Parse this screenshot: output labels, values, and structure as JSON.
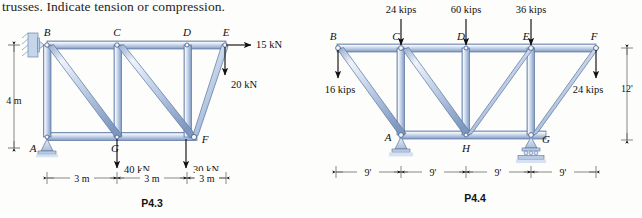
{
  "page": {
    "prompt_text": "trusses. Indicate tension or compression."
  },
  "figures": [
    {
      "caption": "P4.3",
      "units": "kN",
      "joint_labels": [
        "B",
        "C",
        "D",
        "E",
        "A",
        "G",
        "F"
      ],
      "loads": [
        {
          "label": "15 kN",
          "at": "E",
          "direction": "right"
        },
        {
          "label": "20 kN",
          "at": "E",
          "direction": "down"
        },
        {
          "label": "40 kN",
          "at": "G",
          "direction": "down"
        },
        {
          "label": "30 kN",
          "at": "F",
          "direction": "down"
        }
      ],
      "dimensions": {
        "vertical": "4 m",
        "horizontal": [
          "3 m",
          "3 m",
          "3 m"
        ]
      },
      "supports": [
        {
          "at": "B",
          "type": "wall-pin"
        },
        {
          "at": "A",
          "type": "pin"
        }
      ]
    },
    {
      "caption": "P4.4",
      "units": "kips",
      "joint_labels": [
        "B",
        "C",
        "D",
        "E",
        "F",
        "A",
        "H",
        "G"
      ],
      "loads": [
        {
          "label": "24 kips",
          "at": "C",
          "direction": "down"
        },
        {
          "label": "60 kips",
          "at": "D",
          "direction": "down"
        },
        {
          "label": "36 kips",
          "at": "E",
          "direction": "down"
        },
        {
          "label": "16 kips",
          "at": "B",
          "direction": "down"
        },
        {
          "label": "24 kips",
          "at": "F",
          "direction": "down"
        }
      ],
      "dimensions": {
        "vertical": "12'",
        "horizontal": [
          "9'",
          "9'",
          "9'",
          "9'"
        ]
      },
      "supports": [
        {
          "at": "A",
          "type": "pin"
        },
        {
          "at": "G",
          "type": "rocker"
        }
      ]
    }
  ],
  "colors": {
    "member_light": "#e8eef8",
    "member_mid": "#aabedd",
    "member_dark": "#7f99c2",
    "outline": "#4a5f86",
    "ink": "#111111",
    "support_fill": "#c9d7ea",
    "hatch": "#9fb4d2"
  }
}
